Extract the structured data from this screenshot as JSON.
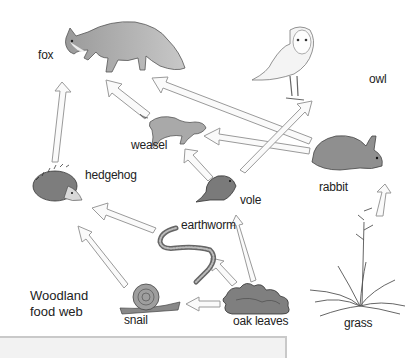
{
  "diagram": {
    "title_line1": "Woodland",
    "title_line2": "food web",
    "organisms": {
      "fox": "fox",
      "owl": "owl",
      "weasel": "weasel",
      "hedgehog": "hedgehog",
      "rabbit": "rabbit",
      "vole": "vole",
      "earthworm": "earthworm",
      "snail": "snail",
      "oak_leaves": "oak leaves",
      "grass": "grass"
    },
    "links": [
      {
        "from": "hedgehog",
        "to": "fox"
      },
      {
        "from": "weasel",
        "to": "fox"
      },
      {
        "from": "rabbit",
        "to": "fox"
      },
      {
        "from": "rabbit",
        "to": "weasel"
      },
      {
        "from": "vole",
        "to": "weasel"
      },
      {
        "from": "vole",
        "to": "owl"
      },
      {
        "from": "earthworm",
        "to": "hedgehog"
      },
      {
        "from": "snail",
        "to": "hedgehog"
      },
      {
        "from": "oak leaves",
        "to": "vole"
      },
      {
        "from": "oak leaves",
        "to": "earthworm"
      },
      {
        "from": "oak leaves",
        "to": "snail"
      },
      {
        "from": "grass",
        "to": "rabbit"
      }
    ],
    "colors": {
      "arrow_fill": "#fafafa",
      "arrow_stroke": "#9a9a9a",
      "animal_gray": "#8a8a8a"
    }
  }
}
